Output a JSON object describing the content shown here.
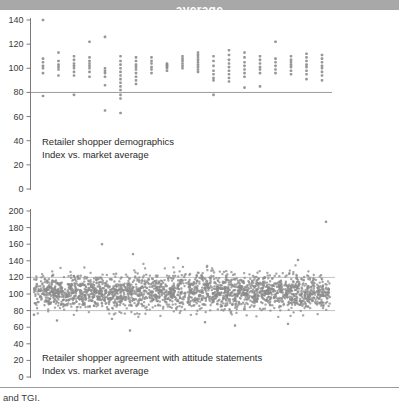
{
  "banner": {
    "visible_text": "average"
  },
  "footer": {
    "source_text": "and TGI."
  },
  "colors": {
    "banner_bg": "#a8a8a8",
    "banner_text": "#ffffff",
    "marker": "#8c8c8c",
    "axis": "#7a7a7a",
    "tick_label": "#3a3a3a",
    "reference_line_top": "#9a9a9a",
    "reference_line_bottom": "#c2c2c2",
    "footer_rule": "#9a9a9a"
  },
  "chart_data": [
    {
      "type": "scatter",
      "id": "retailer-demographics",
      "annotation": {
        "line1": "Retailer shopper demographics",
        "line2": "Index vs. market average"
      },
      "ylim": [
        0,
        140
      ],
      "yticks": [
        0,
        20,
        40,
        60,
        80,
        100,
        120,
        140
      ],
      "reference_lines": [
        80
      ],
      "legend": "none",
      "grid": "off",
      "groups": [
        [
          140,
          108,
          105,
          102,
          100,
          96,
          77
        ],
        [
          113,
          106,
          103,
          101,
          99,
          94
        ],
        [
          110,
          107,
          104,
          102,
          100,
          97,
          94,
          78
        ],
        [
          122,
          109,
          106,
          104,
          102,
          100,
          97,
          93
        ],
        [
          126,
          100,
          98,
          96,
          93,
          86,
          65
        ],
        [
          110,
          106,
          103,
          100,
          97,
          94,
          91,
          88,
          85,
          82,
          78,
          75,
          63
        ],
        [
          109,
          106,
          103,
          101,
          99,
          96,
          93,
          90,
          87
        ],
        [
          109,
          106,
          104,
          101,
          99,
          96
        ],
        [
          104,
          103,
          102,
          101,
          100,
          98
        ],
        [
          110,
          108,
          106,
          104,
          102,
          100
        ],
        [
          113,
          111,
          109,
          107,
          105,
          103,
          101,
          99,
          97
        ],
        [
          110,
          106,
          102,
          98,
          95,
          92,
          90,
          78
        ],
        [
          115,
          111,
          107,
          104,
          101,
          98,
          95,
          92,
          89
        ],
        [
          113,
          109,
          105,
          102,
          99,
          96,
          93,
          84
        ],
        [
          110,
          107,
          104,
          101,
          99,
          96,
          85
        ],
        [
          122,
          108,
          105,
          102,
          99,
          96
        ],
        [
          110,
          107,
          105,
          103,
          101,
          98,
          95
        ],
        [
          112,
          109,
          106,
          103,
          101,
          98,
          95,
          91
        ],
        [
          111,
          108,
          105,
          102,
          100,
          97,
          94,
          90
        ]
      ]
    },
    {
      "type": "scatter",
      "id": "retailer-attitude-statements",
      "annotation": {
        "line1": "Retailer shopper agreement with attitude statements",
        "line2": "Index vs. market average"
      },
      "ylim": [
        0,
        200
      ],
      "yticks": [
        0,
        20,
        40,
        60,
        80,
        100,
        120,
        140,
        160,
        180,
        200
      ],
      "reference_lines": [
        80,
        120
      ],
      "legend": "none",
      "grid": "off",
      "cloud": {
        "n": 2400,
        "mean": 103,
        "sd": 10,
        "clip_min": 72,
        "clip_max": 142,
        "seed": 1337
      },
      "outliers": [
        [
          326,
          187
        ],
        [
          102,
          160
        ],
        [
          133,
          148
        ],
        [
          298,
          141
        ],
        [
          178,
          143
        ],
        [
          57,
          68
        ],
        [
          130,
          56
        ],
        [
          112,
          70
        ],
        [
          288,
          64
        ],
        [
          235,
          62
        ],
        [
          34,
          75
        ],
        [
          205,
          66
        ]
      ]
    }
  ]
}
